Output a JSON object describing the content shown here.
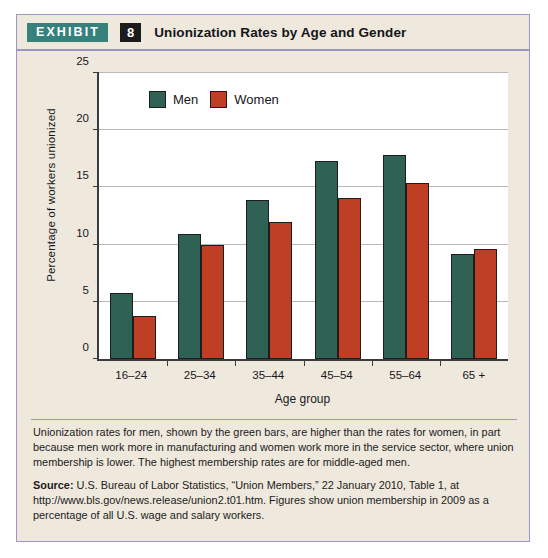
{
  "header": {
    "tag": "EXHIBIT",
    "number": "8",
    "title": "Unionization Rates by Age and Gender"
  },
  "colors": {
    "men": "#2f6254",
    "women": "#bf3f25",
    "tag_background": "#36817c",
    "number_background": "#1b1b1b",
    "card_background": "#efe9dd",
    "border": "#9d96c4",
    "plot_background": "#ffffff",
    "gridline": "#b9b9b9"
  },
  "chart_data": {
    "type": "bar",
    "title": "Unionization Rates by Age and Gender",
    "xlabel": "Age group",
    "ylabel": "Percentage of workers unionized",
    "categories": [
      "16–24",
      "25–34",
      "35–44",
      "45–54",
      "55–64",
      "65 +"
    ],
    "series": [
      {
        "name": "Men",
        "color": "#2f6254",
        "values": [
          5.8,
          10.9,
          13.9,
          17.3,
          17.8,
          9.2
        ]
      },
      {
        "name": "Women",
        "color": "#bf3f25",
        "values": [
          3.8,
          10.0,
          12.0,
          14.1,
          15.4,
          9.6
        ]
      }
    ],
    "ylim": [
      0,
      25
    ],
    "yticks": [
      0,
      5,
      10,
      15,
      20,
      25
    ],
    "ytick_labels": [
      "0",
      "5",
      "10",
      "15",
      "20",
      "25"
    ],
    "grid": true,
    "legend_position": "inside-top-left"
  },
  "notes": {
    "body": "Unionization rates for men, shown by the green bars, are higher than the rates for women, in part because men work more in manufacturing and women work more in the service sector, where union membership is lower. The highest membership rates are for middle-aged men.",
    "source_label": "Source:",
    "source_text": " U.S. Bureau of Labor Statistics, “Union Members,” 22 January 2010, Table 1, at http://www.bls.gov/news.release/union2.t01.htm. Figures show union membership in 2009 as a percentage of all U.S. wage and salary workers."
  }
}
